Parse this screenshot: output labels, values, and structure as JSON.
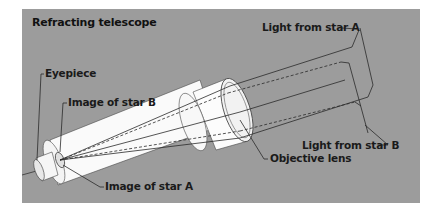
{
  "title": "Refracting telescope",
  "labels": {
    "eyepiece": "Eyepiece",
    "image_star_b": "Image of star B",
    "image_star_a": "Image of star A",
    "objective_lens": "Objective lens",
    "light_star_a": "Light from star A",
    "light_star_b": "Light from star B"
  },
  "colors": {
    "background": "#9c9c9c",
    "tube": "#fbfbfb",
    "tube_shade": "#dcdcdc",
    "line": "#2a2a2a",
    "text": "#1a1a1a"
  },
  "legend": {
    "solid_rays": "Light from star A",
    "dashed_rays": "Light from star B"
  }
}
